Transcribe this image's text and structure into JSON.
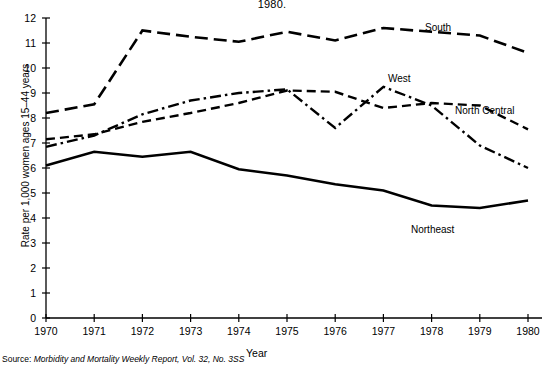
{
  "figure": {
    "title": "1980.",
    "source_prefix": "Source:",
    "source_text": "Morbidity and Mortality Weekly Report, Vol. 32, No. 3SS"
  },
  "axes": {
    "xlabel": "Year",
    "ylabel": "Rate per 1,000 women ages 15–44 years",
    "y_ticks": [
      "0",
      "1",
      "2",
      "3",
      "4",
      "5",
      "6",
      "7",
      "8",
      "9",
      "10",
      "11",
      "12"
    ],
    "x_ticks": [
      "1970",
      "1971",
      "1972",
      "1973",
      "1974",
      "1975",
      "1976",
      "1977",
      "1978",
      "1979",
      "1980"
    ]
  },
  "labels": {
    "south": "South",
    "west": "West",
    "north_central": "North Central",
    "northeast": "Northeast"
  },
  "chart_data": {
    "type": "line",
    "title": "1980.",
    "xlabel": "Year",
    "ylabel": "Rate per 1,000 women ages 15–44 years",
    "x": [
      1970,
      1971,
      1972,
      1973,
      1974,
      1975,
      1976,
      1977,
      1978,
      1979,
      1980
    ],
    "xlim": [
      1970,
      1980
    ],
    "ylim": [
      0,
      12
    ],
    "grid": false,
    "legend_position": "inline-annotations",
    "series": [
      {
        "name": "South",
        "style": "long-dash",
        "values": [
          8.2,
          8.55,
          11.5,
          11.25,
          11.05,
          11.45,
          11.1,
          11.6,
          11.45,
          11.3,
          10.6
        ]
      },
      {
        "name": "West",
        "style": "dash-dot",
        "values": [
          6.85,
          7.3,
          8.15,
          8.7,
          9.0,
          9.15,
          9.25,
          9.15,
          8.6,
          7.6,
          9.25
        ]
      },
      {
        "name": "North Central",
        "style": "short-dash",
        "values": [
          7.15,
          7.35,
          7.85,
          8.2,
          8.6,
          9.1,
          9.05,
          8.4,
          8.6,
          8.5,
          7.95
        ]
      },
      {
        "name": "Northeast",
        "style": "solid",
        "values": [
          6.1,
          6.65,
          6.45,
          6.65,
          5.95,
          5.7,
          5.35,
          5.1,
          4.5,
          4.4,
          4.7
        ]
      }
    ],
    "series_corrected": {
      "west": [
        6.85,
        7.3,
        8.15,
        8.7,
        9.0,
        9.15,
        7.6,
        9.25,
        8.5,
        6.9,
        6.0
      ],
      "north_central": [
        7.15,
        7.35,
        7.85,
        8.2,
        8.6,
        9.1,
        9.05,
        8.4,
        8.6,
        8.5,
        7.55
      ]
    }
  }
}
